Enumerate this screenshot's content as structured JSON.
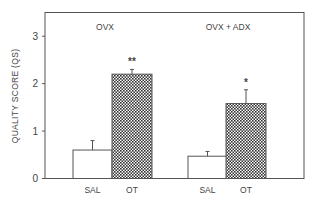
{
  "chart_data": {
    "type": "bar",
    "title": "",
    "ylabel": "QUALITY SCORE (QS)",
    "xlabel": "",
    "ylim": [
      0,
      3.5
    ],
    "yticks": [
      0,
      1,
      2,
      3
    ],
    "grid": false,
    "groups": [
      {
        "label": "OVX",
        "categories": [
          "SAL",
          "OT"
        ],
        "values": [
          0.6,
          2.2
        ],
        "errors": [
          0.2,
          0.1
        ],
        "significance": [
          "",
          "**"
        ]
      },
      {
        "label": "OVX + ADX",
        "categories": [
          "SAL",
          "OT"
        ],
        "values": [
          0.47,
          1.58
        ],
        "errors": [
          0.1,
          0.29
        ],
        "significance": [
          "",
          "*"
        ]
      }
    ],
    "series_styles": {
      "SAL": {
        "fill": "open/white"
      },
      "OT": {
        "fill": "crosshatch"
      }
    }
  },
  "colors": {
    "axis": "#555555",
    "bar_stroke": "#555555",
    "hatch_dark": "#333333",
    "text": "#444444"
  }
}
